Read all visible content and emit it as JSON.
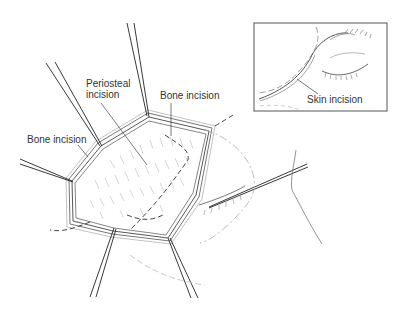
{
  "diagram": {
    "type": "surgical illustration",
    "labels": {
      "periosteal_incision_line1": "Periosteal",
      "periosteal_incision_line2": "incision",
      "bone_incision_top": "Bone incision",
      "bone_incision_left": "Bone incision",
      "skin_incision": "Skin incision"
    },
    "colors": {
      "line": "#222222",
      "light_line": "#888888",
      "inset_border": "#555555",
      "background": "#ffffff"
    }
  }
}
